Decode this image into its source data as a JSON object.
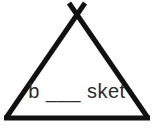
{
  "figure": {
    "background_color": "#ffffff",
    "stroke_color": "#111111",
    "stroke_width": 5,
    "canvas": {
      "width": 154,
      "height": 131
    }
  },
  "shape": {
    "name": "crossed-apex-triangle",
    "description": "Triangle with two slanted legs crossing above the apex forming an X",
    "apex_crossing": {
      "x": 77,
      "y": 13
    },
    "left_base": {
      "x": 6,
      "y": 118
    },
    "right_base": {
      "x": 148,
      "y": 118
    },
    "left_leg_tip": {
      "x": 85,
      "y": 3
    },
    "right_leg_tip": {
      "x": 69,
      "y": 3
    },
    "base_line": {
      "x1": 6,
      "y1": 118,
      "x2": 148,
      "y2": 118
    }
  },
  "puzzle": {
    "text": "b ___ sket",
    "answer_prefix": "b",
    "blank": "___",
    "answer_suffix": "sket",
    "text_color": "#2b2b2b",
    "font_size": "20px"
  }
}
